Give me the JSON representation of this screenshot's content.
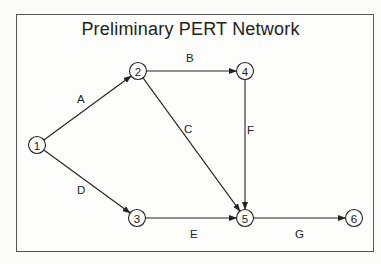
{
  "diagram": {
    "title": "Preliminary PERT Network",
    "type": "PERT activity-on-arrow network",
    "nodes": [
      {
        "id": "1",
        "label": "1",
        "x": 37,
        "y": 145
      },
      {
        "id": "2",
        "label": "2",
        "x": 138,
        "y": 71
      },
      {
        "id": "3",
        "label": "3",
        "x": 137,
        "y": 218
      },
      {
        "id": "4",
        "label": "4",
        "x": 245,
        "y": 71
      },
      {
        "id": "5",
        "label": "5",
        "x": 245,
        "y": 218
      },
      {
        "id": "6",
        "label": "6",
        "x": 354,
        "y": 218
      }
    ],
    "edges": [
      {
        "activity": "A",
        "from": "1",
        "to": "2",
        "label_x": 77,
        "label_y": 103
      },
      {
        "activity": "B",
        "from": "2",
        "to": "4",
        "label_x": 186,
        "label_y": 62
      },
      {
        "activity": "C",
        "from": "2",
        "to": "5",
        "label_x": 184,
        "label_y": 133
      },
      {
        "activity": "D",
        "from": "1",
        "to": "3",
        "label_x": 77,
        "label_y": 194
      },
      {
        "activity": "E",
        "from": "3",
        "to": "5",
        "label_x": 190,
        "label_y": 238
      },
      {
        "activity": "F",
        "from": "4",
        "to": "5",
        "label_x": 247,
        "label_y": 134
      },
      {
        "activity": "G",
        "from": "5",
        "to": "6",
        "label_x": 295,
        "label_y": 238
      }
    ]
  }
}
